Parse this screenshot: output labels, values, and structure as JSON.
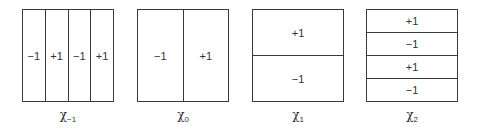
{
  "diagrams": [
    {
      "id": "chi_minus_1",
      "orientation": "columns",
      "cells": [
        "−1",
        "+1",
        "−1",
        "+1"
      ],
      "label_symbol": "χ",
      "label_subscript": "−1"
    },
    {
      "id": "chi_0",
      "orientation": "columns",
      "cells": [
        "−1",
        "+1"
      ],
      "label_symbol": "χ",
      "label_subscript": "0"
    },
    {
      "id": "chi_1",
      "orientation": "rows",
      "cells": [
        "+1",
        "−1"
      ],
      "label_symbol": "χ",
      "label_subscript": "1"
    },
    {
      "id": "chi_2",
      "orientation": "rows",
      "cells": [
        "+1",
        "−1",
        "+1",
        "−1"
      ],
      "label_symbol": "χ",
      "label_subscript": "2"
    }
  ]
}
